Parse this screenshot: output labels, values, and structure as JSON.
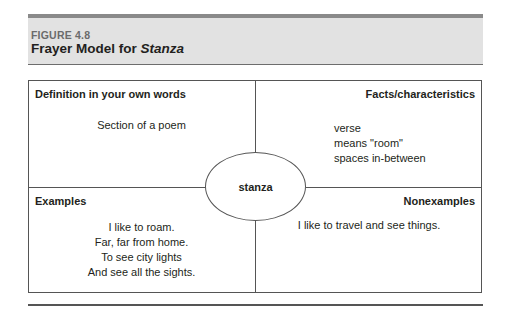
{
  "figure": {
    "label": "FIGURE 4.8",
    "title_prefix": "Frayer Model for ",
    "title_term": "Stanza"
  },
  "center_term": "stanza",
  "quadrants": {
    "definition": {
      "heading": "Definition in your own words",
      "lines": [
        "Section of a poem"
      ]
    },
    "facts": {
      "heading": "Facts/characteristics",
      "lines": [
        "verse",
        "means \"room\"",
        "spaces in-between"
      ]
    },
    "examples": {
      "heading": "Examples",
      "lines": [
        "I like to roam.",
        "Far, far from home.",
        "To see city lights",
        "And see all the sights."
      ]
    },
    "nonexamples": {
      "heading": "Nonexamples",
      "lines": [
        "I like to travel and see things."
      ]
    }
  },
  "colors": {
    "header_bg": "#e2e2e2",
    "top_bar": "#8a8a8a",
    "border": "#555555",
    "label_gray": "#6b6b6b"
  }
}
